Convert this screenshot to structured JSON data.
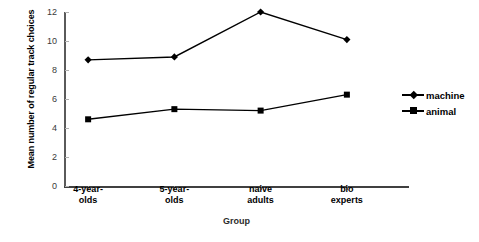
{
  "chart_data": {
    "type": "line",
    "title": "",
    "xlabel": "Group",
    "ylabel": "Mean number of regular track choices",
    "categories": [
      "4-year-olds",
      "5-year-olds",
      "naive adults",
      "bio experts"
    ],
    "category_lines": [
      [
        "4-year-",
        "olds"
      ],
      [
        "5-year-",
        "olds"
      ],
      [
        "naive",
        "adults"
      ],
      [
        "bio",
        "experts"
      ]
    ],
    "series": [
      {
        "name": "machine",
        "marker": "diamond",
        "color": "#000000",
        "values": [
          8.7,
          8.9,
          12.0,
          10.1
        ]
      },
      {
        "name": "animal",
        "marker": "square",
        "color": "#000000",
        "values": [
          4.6,
          5.3,
          5.2,
          6.3
        ]
      }
    ],
    "ylim": [
      0,
      12
    ],
    "ytick_labels": [
      "0",
      "2",
      "4",
      "6",
      "8",
      "10",
      "12"
    ],
    "ytick_values": [
      0,
      2,
      4,
      6,
      8,
      10,
      12
    ],
    "grid": false,
    "legend_position": "right"
  },
  "legend": {
    "entries": [
      {
        "label": "machine"
      },
      {
        "label": "animal"
      }
    ]
  },
  "axis": {
    "y_title": "Mean number of regular track choices",
    "x_title": "Group"
  }
}
